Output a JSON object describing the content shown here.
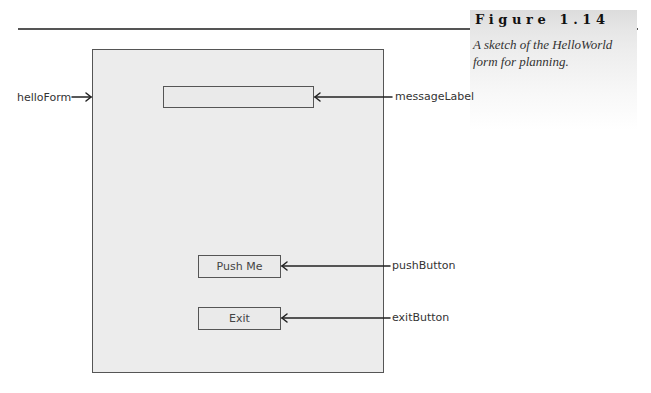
{
  "figure": {
    "title": "Figure 1.14",
    "caption": "A sketch of the HelloWorld form for planning."
  },
  "form": {
    "name": "helloForm",
    "controls": {
      "message_label": {
        "name": "messageLabel",
        "text": ""
      },
      "push_button": {
        "name": "pushButton",
        "text": "Push Me"
      },
      "exit_button": {
        "name": "exitButton",
        "text": "Exit"
      }
    }
  },
  "annotations": {
    "hello_form": "helloForm",
    "message_label": "messageLabel",
    "push_button": "pushButton",
    "exit_button": "exitButton"
  },
  "colors": {
    "form_fill": "#ececec",
    "outline": "#555555",
    "header_gray": "#dcdcdc"
  }
}
